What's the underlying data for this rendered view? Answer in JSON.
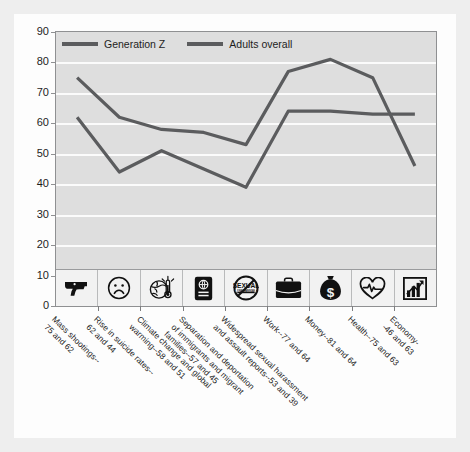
{
  "chart_data": {
    "type": "line",
    "title": "",
    "subtitle": "",
    "xlabel": "",
    "ylabel": "Percent feeling stressed by issues in the national news",
    "ylim": [
      0,
      90
    ],
    "ytick_step": 10,
    "yticks": [
      "0",
      "10",
      "20",
      "30",
      "40",
      "50",
      "60",
      "70",
      "80",
      "90"
    ],
    "grid": "horizontal",
    "legend_position": "top-left",
    "categories": [
      "Mass shootings--\n75 and 62",
      "Rise in suicide rates--\n62 and 44",
      "Climate change and global\nwarming--58 and 51",
      "Separation and deportation\nof immigrants and migrant\nfamilies--57 and 45",
      "Widespread sexual harassment\nand assault reports--53 and 39",
      "Work--77 and 64",
      "Money--81 and 64",
      "Health--75 and 63",
      "Economy--46 and 63"
    ],
    "category_icons": [
      "handgun-icon",
      "sad-face-icon",
      "globe-thermometer-icon",
      "passport-icon",
      "no-sexual-harassment-icon",
      "briefcase-icon",
      "money-bag-icon",
      "heart-pulse-icon",
      "bar-chart-arrow-icon"
    ],
    "series": [
      {
        "name": "Generation Z",
        "color": "#5b5c5e",
        "values": [
          75,
          62,
          58,
          57,
          53,
          77,
          81,
          75,
          46
        ]
      },
      {
        "name": "Adults overall",
        "color": "#5b5c5e",
        "values": [
          62,
          44,
          51,
          45,
          39,
          64,
          64,
          63,
          63
        ]
      }
    ]
  },
  "legend": {
    "items": [
      {
        "label": "Generation Z"
      },
      {
        "label": "Adults overall"
      }
    ]
  },
  "colors": {
    "line": "#5b5c5e",
    "panel_background": "#dedede",
    "gridline": "#fbfbfb",
    "page_background": "#fdfdfd",
    "outer_background": "#eeeeee",
    "axis": "#8f9092",
    "text": "#1d1d1d"
  }
}
